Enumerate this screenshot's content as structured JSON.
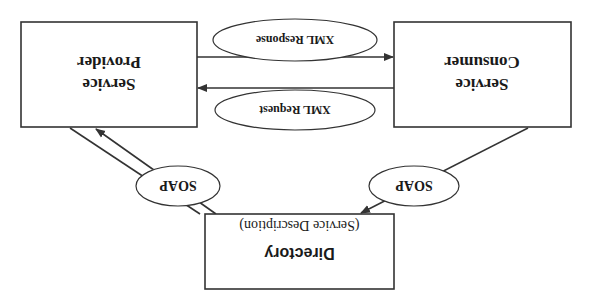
{
  "diagram": {
    "orientation": "rotated-180",
    "nodes": {
      "provider": {
        "line1": "Service",
        "line2": "Provider"
      },
      "consumer": {
        "line1": "Service",
        "line2": "Consumer"
      },
      "directory": {
        "title": "Directory",
        "subtitle": "(Service Description)"
      }
    },
    "edges": {
      "xml_response": {
        "label": "XML Response",
        "from": "Service Provider",
        "to": "Service Consumer"
      },
      "xml_request": {
        "label": "XML Request",
        "from": "Service Consumer",
        "to": "Service Provider"
      },
      "soap_left": {
        "label": "SOAP",
        "between": "Service Provider / Directory"
      },
      "soap_right": {
        "label": "SOAP",
        "between": "Service Consumer / Directory"
      }
    },
    "colors": {
      "stroke": "#333333",
      "text": "#1a1a1a",
      "background": "#ffffff"
    }
  }
}
